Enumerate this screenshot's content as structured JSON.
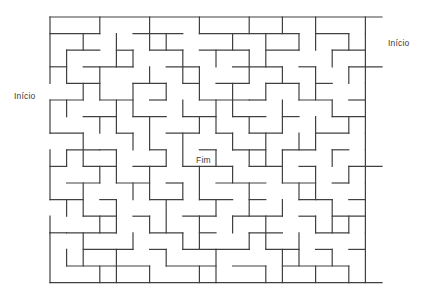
{
  "figure": {
    "kind": "maze-puzzle",
    "title": "",
    "background_color": "#ffffff",
    "wall_color": "#404040",
    "wall_thickness": 1.2
  },
  "labels": {
    "start_left": "Início",
    "start_right": "Início",
    "goal": "Fim"
  },
  "maze": {
    "cols": 20,
    "rows": 16,
    "cell": 16.6,
    "origin_x": 50,
    "origin_y": 17,
    "entrances": [
      {
        "name": "start-left",
        "side": "left",
        "row": 4,
        "label": "Início"
      },
      {
        "name": "start-right",
        "side": "right",
        "row": 1,
        "label": "Início"
      }
    ],
    "goal_cell": {
      "col": 9,
      "row": 8,
      "label": "Fim"
    },
    "h_walls": [
      [
        0,
        0,
        20
      ],
      [
        0,
        1,
        3
      ],
      [
        5,
        1,
        3
      ],
      [
        9,
        1,
        6
      ],
      [
        16,
        1,
        2
      ],
      [
        1,
        2,
        2
      ],
      [
        4,
        2,
        1
      ],
      [
        6,
        2,
        2
      ],
      [
        9,
        2,
        3
      ],
      [
        13,
        2,
        2
      ],
      [
        17,
        2,
        2
      ],
      [
        0,
        3,
        1
      ],
      [
        2,
        3,
        3
      ],
      [
        7,
        3,
        2
      ],
      [
        11,
        3,
        3
      ],
      [
        15,
        3,
        1
      ],
      [
        18,
        3,
        2
      ],
      [
        1,
        4,
        2
      ],
      [
        5,
        4,
        2
      ],
      [
        8,
        4,
        1
      ],
      [
        10,
        4,
        2
      ],
      [
        13,
        4,
        2
      ],
      [
        16,
        4,
        1
      ],
      [
        0,
        5,
        2
      ],
      [
        3,
        5,
        2
      ],
      [
        6,
        5,
        1
      ],
      [
        9,
        5,
        3
      ],
      [
        12,
        5,
        1
      ],
      [
        15,
        5,
        2
      ],
      [
        18,
        5,
        1
      ],
      [
        2,
        6,
        2
      ],
      [
        5,
        6,
        2
      ],
      [
        8,
        6,
        2
      ],
      [
        11,
        6,
        2
      ],
      [
        14,
        6,
        1
      ],
      [
        17,
        6,
        2
      ],
      [
        0,
        7,
        2
      ],
      [
        4,
        7,
        1
      ],
      [
        7,
        7,
        2
      ],
      [
        10,
        7,
        1
      ],
      [
        12,
        7,
        2
      ],
      [
        16,
        7,
        2
      ],
      [
        1,
        8,
        2
      ],
      [
        3,
        8,
        1
      ],
      [
        6,
        8,
        1
      ],
      [
        9,
        8,
        1
      ],
      [
        11,
        8,
        2
      ],
      [
        14,
        8,
        2
      ],
      [
        17,
        8,
        1
      ],
      [
        0,
        9,
        1
      ],
      [
        2,
        9,
        2
      ],
      [
        5,
        9,
        2
      ],
      [
        8,
        9,
        3
      ],
      [
        12,
        9,
        2
      ],
      [
        15,
        9,
        1
      ],
      [
        18,
        9,
        2
      ],
      [
        1,
        10,
        2
      ],
      [
        4,
        10,
        2
      ],
      [
        7,
        10,
        1
      ],
      [
        10,
        10,
        3
      ],
      [
        14,
        10,
        2
      ],
      [
        17,
        10,
        1
      ],
      [
        0,
        11,
        2
      ],
      [
        3,
        11,
        1
      ],
      [
        6,
        11,
        2
      ],
      [
        9,
        11,
        2
      ],
      [
        12,
        11,
        1
      ],
      [
        15,
        11,
        2
      ],
      [
        18,
        11,
        1
      ],
      [
        2,
        12,
        2
      ],
      [
        5,
        12,
        1
      ],
      [
        8,
        12,
        2
      ],
      [
        11,
        12,
        3
      ],
      [
        15,
        12,
        1
      ],
      [
        17,
        12,
        2
      ],
      [
        0,
        13,
        1
      ],
      [
        1,
        13,
        3
      ],
      [
        6,
        13,
        2
      ],
      [
        9,
        13,
        1
      ],
      [
        12,
        13,
        2
      ],
      [
        16,
        13,
        2
      ],
      [
        2,
        14,
        3
      ],
      [
        6,
        14,
        1
      ],
      [
        8,
        14,
        4
      ],
      [
        13,
        14,
        2
      ],
      [
        16,
        14,
        1
      ],
      [
        18,
        14,
        1
      ],
      [
        1,
        15,
        5
      ],
      [
        7,
        15,
        3
      ],
      [
        11,
        15,
        2
      ],
      [
        14,
        15,
        4
      ],
      [
        0,
        16,
        20
      ]
    ],
    "v_walls": [
      [
        0,
        0,
        4
      ],
      [
        0,
        5,
        2
      ],
      [
        0,
        8,
        3
      ],
      [
        0,
        12,
        1
      ],
      [
        0,
        13,
        3
      ],
      [
        3,
        0,
        1
      ],
      [
        6,
        0,
        2
      ],
      [
        9,
        0,
        1
      ],
      [
        12,
        0,
        1
      ],
      [
        14,
        0,
        1
      ],
      [
        16,
        0,
        2
      ],
      [
        19,
        0,
        1
      ],
      [
        2,
        1,
        1
      ],
      [
        4,
        1,
        2
      ],
      [
        7,
        1,
        1
      ],
      [
        11,
        1,
        1
      ],
      [
        13,
        1,
        2
      ],
      [
        15,
        1,
        1
      ],
      [
        18,
        1,
        1
      ],
      [
        19,
        1,
        1
      ],
      [
        1,
        2,
        2
      ],
      [
        5,
        2,
        1
      ],
      [
        8,
        2,
        2
      ],
      [
        10,
        2,
        1
      ],
      [
        12,
        2,
        2
      ],
      [
        17,
        2,
        1
      ],
      [
        19,
        2,
        2
      ],
      [
        3,
        3,
        2
      ],
      [
        6,
        3,
        1
      ],
      [
        9,
        3,
        2
      ],
      [
        14,
        3,
        1
      ],
      [
        16,
        3,
        2
      ],
      [
        18,
        3,
        1
      ],
      [
        2,
        4,
        1
      ],
      [
        5,
        4,
        2
      ],
      [
        7,
        4,
        1
      ],
      [
        11,
        4,
        2
      ],
      [
        13,
        4,
        1
      ],
      [
        15,
        4,
        1
      ],
      [
        19,
        4,
        1
      ],
      [
        1,
        5,
        1
      ],
      [
        4,
        5,
        2
      ],
      [
        8,
        5,
        1
      ],
      [
        10,
        5,
        2
      ],
      [
        14,
        5,
        2
      ],
      [
        17,
        5,
        1
      ],
      [
        19,
        5,
        2
      ],
      [
        3,
        6,
        1
      ],
      [
        6,
        6,
        2
      ],
      [
        9,
        6,
        1
      ],
      [
        12,
        6,
        1
      ],
      [
        16,
        6,
        2
      ],
      [
        18,
        6,
        1
      ],
      [
        2,
        7,
        2
      ],
      [
        5,
        7,
        1
      ],
      [
        8,
        7,
        2
      ],
      [
        11,
        7,
        1
      ],
      [
        13,
        7,
        2
      ],
      [
        15,
        7,
        1
      ],
      [
        19,
        7,
        1
      ],
      [
        1,
        8,
        1
      ],
      [
        4,
        8,
        2
      ],
      [
        7,
        8,
        1
      ],
      [
        10,
        8,
        1
      ],
      [
        12,
        8,
        1
      ],
      [
        14,
        8,
        2
      ],
      [
        17,
        8,
        1
      ],
      [
        19,
        8,
        2
      ],
      [
        3,
        9,
        1
      ],
      [
        6,
        9,
        2
      ],
      [
        9,
        9,
        2
      ],
      [
        11,
        9,
        1
      ],
      [
        16,
        9,
        2
      ],
      [
        18,
        9,
        1
      ],
      [
        2,
        10,
        2
      ],
      [
        5,
        10,
        1
      ],
      [
        8,
        10,
        1
      ],
      [
        12,
        10,
        2
      ],
      [
        15,
        10,
        1
      ],
      [
        19,
        10,
        1
      ],
      [
        1,
        11,
        1
      ],
      [
        4,
        11,
        2
      ],
      [
        7,
        11,
        2
      ],
      [
        10,
        11,
        1
      ],
      [
        14,
        11,
        1
      ],
      [
        17,
        11,
        2
      ],
      [
        19,
        11,
        2
      ],
      [
        3,
        12,
        1
      ],
      [
        6,
        12,
        1
      ],
      [
        9,
        12,
        2
      ],
      [
        11,
        12,
        1
      ],
      [
        13,
        12,
        2
      ],
      [
        16,
        12,
        1
      ],
      [
        18,
        12,
        1
      ],
      [
        2,
        13,
        2
      ],
      [
        5,
        13,
        1
      ],
      [
        8,
        13,
        1
      ],
      [
        12,
        13,
        1
      ],
      [
        15,
        13,
        2
      ],
      [
        19,
        13,
        1
      ],
      [
        1,
        14,
        1
      ],
      [
        4,
        14,
        2
      ],
      [
        7,
        14,
        1
      ],
      [
        10,
        14,
        2
      ],
      [
        14,
        14,
        2
      ],
      [
        17,
        14,
        1
      ],
      [
        19,
        14,
        2
      ],
      [
        3,
        15,
        1
      ],
      [
        6,
        15,
        1
      ],
      [
        9,
        15,
        1
      ],
      [
        13,
        15,
        1
      ],
      [
        16,
        15,
        1
      ],
      [
        18,
        15,
        1
      ]
    ]
  }
}
